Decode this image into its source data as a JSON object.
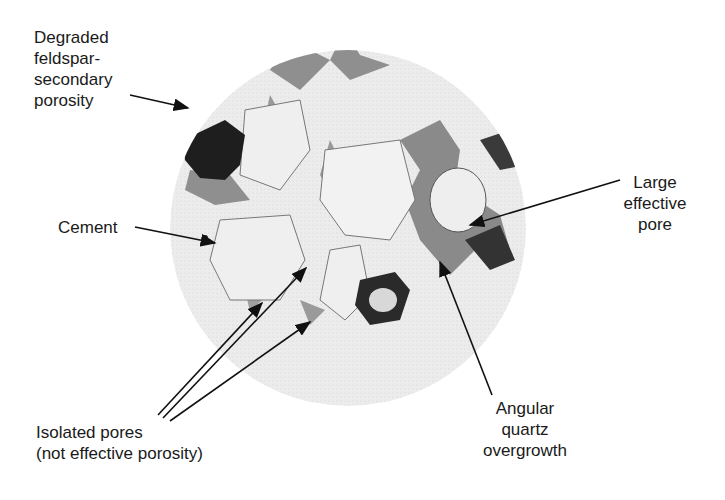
{
  "figure": {
    "colors": {
      "grain": "#e8e8e8",
      "pore_fill": "#8a8a8a",
      "dark_degraded": "#1e1e1e",
      "background": "#ffffff",
      "text": "#1a1a1a"
    }
  },
  "labels": {
    "degraded_feldspar": "Degraded\nfeldspar-\nsecondary\nporosity",
    "cement": "Cement",
    "large_effective_pore": "Large\neffective\npore",
    "isolated_pores": "Isolated pores\n(not effective porosity)",
    "angular_quartz": "Angular\nquartz\novergrowth"
  }
}
